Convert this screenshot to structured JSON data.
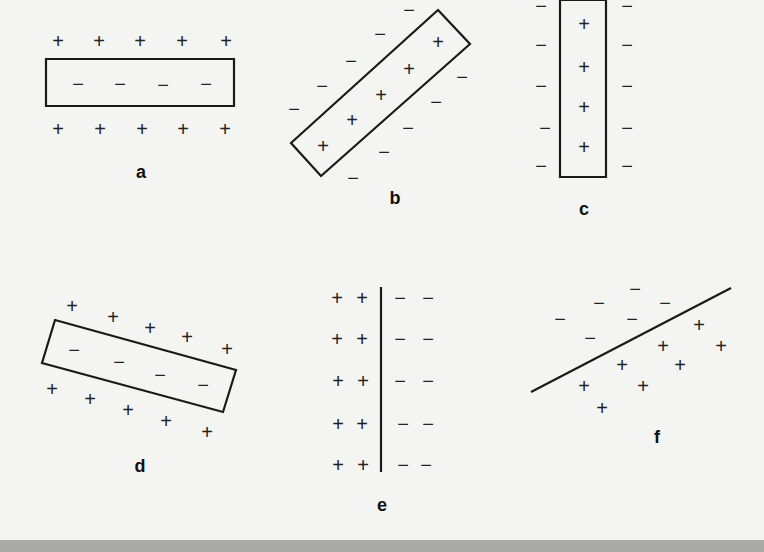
{
  "figure": {
    "colors": {
      "background": "#f4f4f2",
      "ink": "#1a1a1a",
      "bottom_bar": "#a9a9a7"
    },
    "symbols": {
      "plus": "+",
      "minus": "−"
    },
    "panels": [
      {
        "id": "a",
        "label": "a",
        "label_pos": [
          141,
          172
        ],
        "shape": {
          "type": "rect",
          "points": [
            [
              46,
              59
            ],
            [
              234,
              59
            ],
            [
              234,
              106
            ],
            [
              46,
              106
            ]
          ]
        },
        "plus": [
          [
            58,
            41
          ],
          [
            99,
            41
          ],
          [
            140,
            41
          ],
          [
            182,
            41
          ],
          [
            226,
            41
          ],
          [
            58,
            129
          ],
          [
            100,
            129
          ],
          [
            142,
            129
          ],
          [
            183,
            129
          ],
          [
            225,
            129
          ]
        ],
        "minus": [
          [
            78,
            84
          ],
          [
            120,
            84
          ],
          [
            163,
            85
          ],
          [
            206,
            84
          ]
        ]
      },
      {
        "id": "b",
        "label": "b",
        "label_pos": [
          395,
          198
        ],
        "shape": {
          "type": "rect",
          "points": [
            [
              438,
              10
            ],
            [
              470,
              44
            ],
            [
              321,
              176
            ],
            [
              291,
              143
            ]
          ]
        },
        "plus": [
          [
            438,
            42
          ],
          [
            409,
            69
          ],
          [
            381,
            95
          ],
          [
            352,
            120
          ],
          [
            323,
            146
          ]
        ],
        "minus": [
          [
            409,
            10
          ],
          [
            380,
            34
          ],
          [
            351,
            61
          ],
          [
            322,
            86
          ],
          [
            294,
            109
          ],
          [
            462,
            77
          ],
          [
            436,
            102
          ],
          [
            408,
            128
          ],
          [
            384,
            152
          ],
          [
            353,
            178
          ]
        ]
      },
      {
        "id": "c",
        "label": "c",
        "label_pos": [
          584,
          209
        ],
        "shape": {
          "type": "rect",
          "points": [
            [
              560,
              0
            ],
            [
              606,
              0
            ],
            [
              606,
              177
            ],
            [
              560,
              177
            ]
          ]
        },
        "plus": [
          [
            584,
            24
          ],
          [
            584,
            67
          ],
          [
            584,
            107
          ],
          [
            584,
            147
          ]
        ],
        "minus": [
          [
            541,
            6
          ],
          [
            541,
            45
          ],
          [
            541,
            86
          ],
          [
            545,
            128
          ],
          [
            541,
            166
          ],
          [
            627,
            6
          ],
          [
            627,
            45
          ],
          [
            627,
            86
          ],
          [
            627,
            128
          ],
          [
            627,
            166
          ]
        ]
      },
      {
        "id": "d",
        "label": "d",
        "label_pos": [
          140,
          466
        ],
        "shape": {
          "type": "rect",
          "points": [
            [
              55,
              320
            ],
            [
              236,
              370
            ],
            [
              223,
              412
            ],
            [
              42,
              363
            ]
          ]
        },
        "plus": [
          [
            72,
            306
          ],
          [
            113,
            317
          ],
          [
            150,
            328
          ],
          [
            187,
            337
          ],
          [
            227,
            349
          ],
          [
            52,
            389
          ],
          [
            90,
            399
          ],
          [
            128,
            410
          ],
          [
            166,
            421
          ],
          [
            207,
            432
          ]
        ],
        "minus": [
          [
            74,
            350
          ],
          [
            119,
            362
          ],
          [
            160,
            375
          ],
          [
            203,
            385
          ]
        ]
      },
      {
        "id": "e",
        "label": "e",
        "label_pos": [
          382,
          505
        ],
        "shape": {
          "type": "line",
          "points": [
            [
              381,
              287
            ],
            [
              381,
              472
            ]
          ]
        },
        "plus": [
          [
            337,
            298
          ],
          [
            362,
            298
          ],
          [
            337,
            339
          ],
          [
            362,
            339
          ],
          [
            338,
            381
          ],
          [
            363,
            381
          ],
          [
            338,
            424
          ],
          [
            362,
            424
          ],
          [
            338,
            465
          ],
          [
            363,
            465
          ]
        ],
        "minus": [
          [
            400,
            298
          ],
          [
            428,
            298
          ],
          [
            400,
            339
          ],
          [
            428,
            339
          ],
          [
            400,
            381
          ],
          [
            428,
            381
          ],
          [
            403,
            424
          ],
          [
            428,
            424
          ],
          [
            403,
            465
          ],
          [
            426,
            465
          ]
        ]
      },
      {
        "id": "f",
        "label": "f",
        "label_pos": [
          657,
          437
        ],
        "shape": {
          "type": "line",
          "points": [
            [
              531,
              392
            ],
            [
              731,
              288
            ]
          ]
        },
        "plus": [
          [
            699,
            325
          ],
          [
            721,
            346
          ],
          [
            663,
            346
          ],
          [
            680,
            365
          ],
          [
            622,
            365
          ],
          [
            643,
            386
          ],
          [
            584,
            386
          ],
          [
            602,
            408
          ]
        ],
        "minus": [
          [
            635,
            289
          ],
          [
            599,
            303
          ],
          [
            665,
            303
          ],
          [
            560,
            319
          ],
          [
            632,
            319
          ],
          [
            590,
            338
          ]
        ]
      }
    ]
  }
}
